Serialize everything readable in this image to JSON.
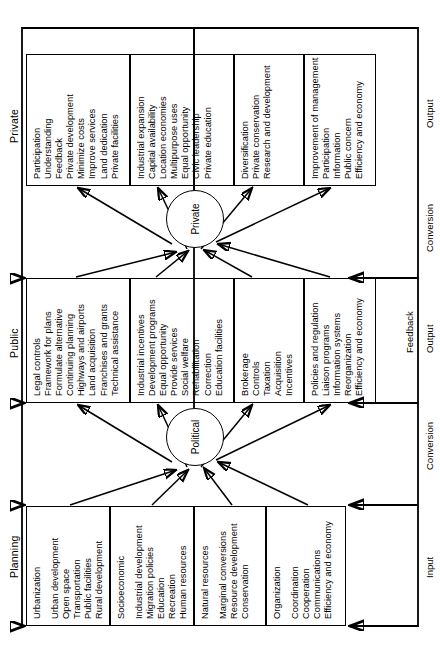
{
  "diagram": {
    "type": "systems-flow",
    "columns": [
      {
        "id": "planning",
        "label": "Planning"
      },
      {
        "id": "public",
        "label": "Public"
      },
      {
        "id": "private",
        "label": "Private"
      }
    ],
    "nodes": [
      {
        "id": "political",
        "label": "Political"
      },
      {
        "id": "private",
        "label": "Private"
      }
    ],
    "axis_labels": [
      {
        "id": "input",
        "label": "Input"
      },
      {
        "id": "conversion-1",
        "label": "Conversion"
      },
      {
        "id": "output-1",
        "label": "Output"
      },
      {
        "id": "feedback",
        "label": "Feedback"
      },
      {
        "id": "conversion-2",
        "label": "Conversion"
      },
      {
        "id": "output-2",
        "label": "Output"
      }
    ],
    "cells": {
      "planning": [
        {
          "id": "planning-urbanization",
          "lead": "Urbanization",
          "items": [
            "Urban development",
            "Open space",
            "Transportation",
            "Public facilities",
            "Rural development"
          ]
        },
        {
          "id": "planning-socioeconomic",
          "lead": "Socioeconomic",
          "items": [
            "Industrial development",
            "Migration policies",
            "Education",
            "Recreation",
            "Human resources"
          ]
        },
        {
          "id": "planning-natural-resources",
          "lead": "Natural resources",
          "items": [
            "Marginal conversions",
            "Resource development",
            "Conservation"
          ]
        },
        {
          "id": "planning-organization",
          "lead": "Organization",
          "items": [
            "Coordination",
            "Cooperation",
            "Communications",
            "Efficiency and economy"
          ]
        }
      ],
      "public": [
        {
          "id": "public-legal",
          "lead": "",
          "items": [
            "Legal controls",
            "Framework for plans",
            "Formulate alternative",
            "Continuing planning",
            "Highways and airports",
            "Land acquisition",
            "Franchises and grants",
            "Technical assistance"
          ]
        },
        {
          "id": "public-incentives",
          "lead": "",
          "items": [
            "Industrial incentives",
            "Development programs",
            "Equal opportunity",
            "Provide services",
            "Social welfare",
            "Rehabilitation",
            "Correction",
            "Education facilities"
          ]
        },
        {
          "id": "public-brokerage",
          "lead": "",
          "items": [
            "Brokerage",
            "Controls",
            "Taxation",
            "Acquisition",
            "Incentives"
          ]
        },
        {
          "id": "public-policies",
          "lead": "",
          "items": [
            "Policies and regulation",
            "Liaison programs",
            "Information systems",
            "Reorganization",
            "Efficiency and economy"
          ]
        }
      ],
      "private": [
        {
          "id": "private-participation",
          "lead": "",
          "items": [
            "Participation",
            "Understanding",
            "Feedback",
            "Private development",
            "Minimize costs",
            "Improve services",
            "Land dedication",
            "Private facilities"
          ]
        },
        {
          "id": "private-industrial",
          "lead": "",
          "items": [
            "Industrial expansion",
            "Capital availability",
            "Location economies",
            "Multipurpose uses",
            "Equal opportunity",
            "Civic leadership",
            "Private education"
          ]
        },
        {
          "id": "private-diversification",
          "lead": "",
          "items": [
            "Diversification",
            "Private conservation",
            "Research and development"
          ]
        },
        {
          "id": "private-improvement",
          "lead": "",
          "items": [
            "Improvement of management",
            "Participation",
            "Information",
            "Public concern",
            "Efficiency and economy"
          ]
        }
      ]
    }
  }
}
